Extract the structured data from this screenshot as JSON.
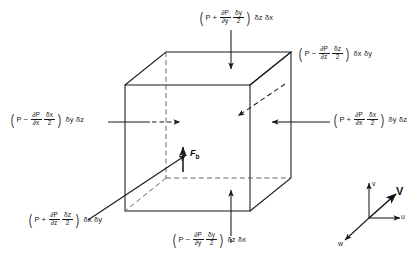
{
  "figure": {
    "caption": ""
  },
  "labels": {
    "top": {
      "id": "top-face-force",
      "pressure_symbol": "P",
      "sign": "+",
      "derivative_numerator": "∂P",
      "derivative_denominator": "∂y",
      "delta_numerator": "δy",
      "delta_denominator": "2",
      "area": "δz δx",
      "full_text": "(P + ∂P/∂y · δy/2) δz δx"
    },
    "top_right": {
      "id": "back-face-force",
      "pressure_symbol": "P",
      "sign": "−",
      "derivative_numerator": "∂P",
      "derivative_denominator": "∂z",
      "delta_numerator": "δz",
      "delta_denominator": "2",
      "area": "δx δy",
      "full_text": "(P − ∂P/∂z · δz/2) δx δy"
    },
    "left": {
      "id": "left-face-force",
      "pressure_symbol": "P",
      "sign": "−",
      "derivative_numerator": "∂P",
      "derivative_denominator": "∂x",
      "delta_numerator": "δx",
      "delta_denominator": "2",
      "area": "δy δz",
      "full_text": "(P − ∂P/∂x · δx/2) δy δz"
    },
    "right": {
      "id": "right-face-force",
      "pressure_symbol": "P",
      "sign": "+",
      "derivative_numerator": "∂P",
      "derivative_denominator": "∂x",
      "delta_numerator": "δx",
      "delta_denominator": "2",
      "area": "δy δz",
      "full_text": "(P + ∂P/∂x · δx/2) δy δz"
    },
    "bottom_left": {
      "id": "front-face-force",
      "pressure_symbol": "P",
      "sign": "+",
      "derivative_numerator": "∂P",
      "derivative_denominator": "∂z",
      "delta_numerator": "δz",
      "delta_denominator": "2",
      "area": "δx δy",
      "full_text": "(P + ∂P/∂z · δz/2) δx δy"
    },
    "bottom": {
      "id": "bottom-face-force",
      "pressure_symbol": "P",
      "sign": "−",
      "derivative_numerator": "∂P",
      "derivative_denominator": "∂y",
      "delta_numerator": "δy",
      "delta_denominator": "2",
      "area": "δz δx",
      "full_text": "(P − ∂P/∂y · δy/2) δz δx"
    }
  },
  "body_force": {
    "symbol": "F",
    "subscript": "b",
    "direction": "up"
  },
  "axes": {
    "u": "u",
    "v": "v",
    "w": "w",
    "velocity": "V"
  },
  "colors": {
    "line": "#1a1a1a",
    "text": "#1a1a1a",
    "background": "#ffffff"
  }
}
